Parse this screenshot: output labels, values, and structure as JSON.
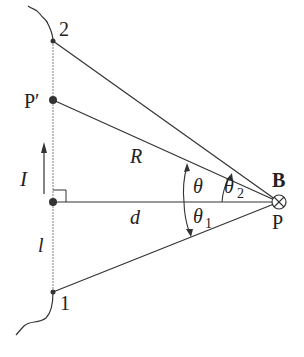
{
  "diagram": {
    "labels": {
      "point_2": "2",
      "point_1": "1",
      "point_p_prime": "P′",
      "point_p": "P",
      "current": "I",
      "field": "B",
      "distance_R": "R",
      "distance_d": "d",
      "length_l": "l",
      "angle_theta": "θ",
      "angle_theta1": "θ",
      "angle_theta1_sub": "1",
      "angle_theta2": "θ",
      "angle_theta2_sub": "2"
    },
    "colors": {
      "line": "#333333",
      "wire": "#aaaaaa",
      "text": "#222222"
    }
  }
}
